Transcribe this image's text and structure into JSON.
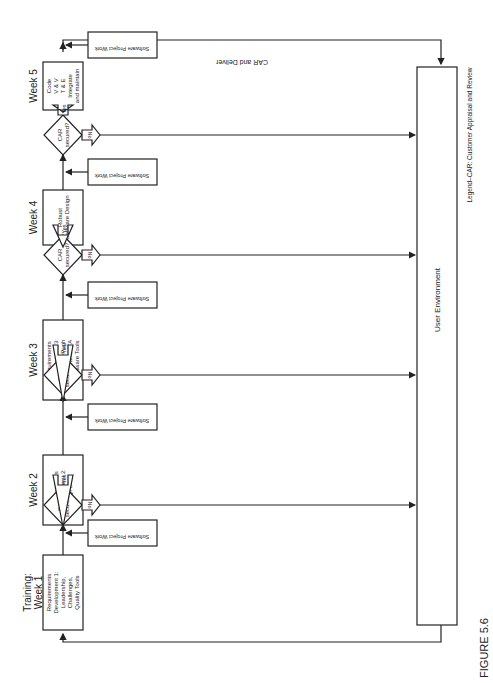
{
  "figure_label": "FIGURE 5.6",
  "legend": "Legend–CAR: Customer Appraisal and Review",
  "user_environment": "User Environment",
  "car_and_deliver": "CAR and Deliver",
  "decision_label": [
    "CAR",
    "secured?"
  ],
  "yes_label": "Yes",
  "no_label": "No",
  "software_project_work": "Software Project Work",
  "stages": [
    {
      "title": [
        "Training:",
        "Week 1"
      ],
      "lines": [
        "Requirements",
        "Development 1:",
        "Leadership,",
        "Challenges,",
        "Quality Tools"
      ]
    },
    {
      "title": [
        "Week 2"
      ],
      "lines": [
        "Requirements",
        "Development 2:",
        "QFD"
      ]
    },
    {
      "title": [
        "Week 3"
      ],
      "lines": [
        "Requirements",
        "Development 3:",
        "TRIZ and Pugh",
        "FMEA and FTA",
        "Software Tools"
      ]
    },
    {
      "title": [
        "Week 4"
      ],
      "lines": [
        "Robust",
        "Software Design"
      ]
    },
    {
      "title": [
        "Week 5"
      ],
      "lines": [
        "Code",
        "V & V",
        "T & E",
        "Integrate",
        "and maintain"
      ]
    }
  ],
  "colors": {
    "line": "#222222",
    "background": "#ffffff"
  }
}
